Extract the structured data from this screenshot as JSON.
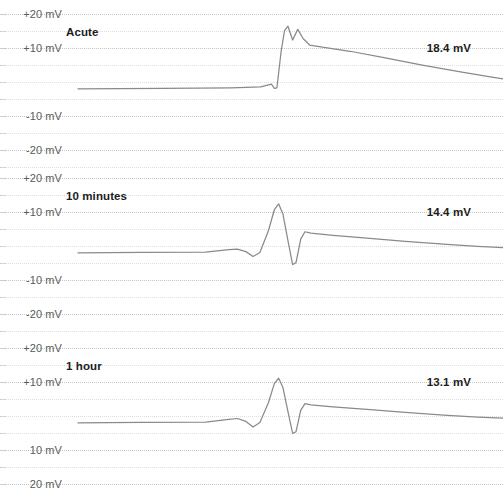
{
  "figure": {
    "background_color": "#ffffff",
    "trace_color": "#8a8a8a",
    "grid_color": "#cfcfcf",
    "label_color": "#5b5b5b",
    "title_color": "#1d1d1d"
  },
  "chart_data": {
    "type": "line",
    "title": "",
    "xlabel": "",
    "ylabel": "mV",
    "grid": true,
    "legend_position": "none",
    "panels": [
      {
        "label": "Acute",
        "value_label": "18.4 mV",
        "peak_amplitude_mv": 18.4,
        "ylim": [
          -25,
          22
        ],
        "y_ticks": [
          "+20 mV",
          "+10 mV",
          "-10 mV",
          "-20 mV"
        ],
        "y_tick_values": [
          20,
          10,
          -10,
          -20
        ],
        "baseline_mv": -2.0,
        "spike_onset_x": 0.44,
        "description": "Slow depolarising drift to a fast upstroke with a notched double peak, followed by a long gradual repolarising decay."
      },
      {
        "label": "10 minutes",
        "value_label": "14.4 mV",
        "peak_amplitude_mv": 14.4,
        "ylim": [
          -25,
          22
        ],
        "y_ticks": [
          "+20 mV",
          "+10 mV",
          "-10 mV",
          "-20 mV"
        ],
        "y_tick_values": [
          20,
          10,
          -10,
          -20
        ],
        "baseline_mv": -2.0,
        "spike_onset_x": 0.44,
        "description": "Narrow high-amplitude spike with a deep undershoot, small rebound shoulder and slow decaying tail."
      },
      {
        "label": "1 hour",
        "value_label": "13.1 mV",
        "peak_amplitude_mv": 13.1,
        "ylim": [
          -25,
          22
        ],
        "y_ticks": [
          "+20 mV",
          "+10 mV",
          "10 mV",
          "20 mV"
        ],
        "y_tick_values": [
          20,
          10,
          -10,
          -20
        ],
        "baseline_mv": -2.0,
        "spike_onset_x": 0.44,
        "description": "Narrow spike with undershoot and rebound shoulder, decaying tail; panel clipped at the bottom of the view."
      }
    ]
  }
}
